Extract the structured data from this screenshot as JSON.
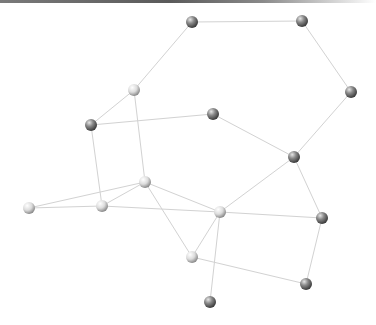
{
  "graph": {
    "colors": {
      "edge": "#d2d2d2",
      "node_light": "#f2f2f2",
      "node_dark": "#6e6e6e",
      "topbar": "#5a5a5a"
    },
    "nodes": [
      {
        "id": "n0",
        "x": 192,
        "y": 22,
        "shade": "dark"
      },
      {
        "id": "n1",
        "x": 302,
        "y": 21,
        "shade": "dark"
      },
      {
        "id": "n2",
        "x": 351,
        "y": 92,
        "shade": "dark"
      },
      {
        "id": "n3",
        "x": 134,
        "y": 90,
        "shade": "light"
      },
      {
        "id": "n4",
        "x": 91,
        "y": 125,
        "shade": "dark"
      },
      {
        "id": "n5",
        "x": 213,
        "y": 114,
        "shade": "dark"
      },
      {
        "id": "n6",
        "x": 294,
        "y": 157,
        "shade": "dark"
      },
      {
        "id": "n7",
        "x": 145,
        "y": 182,
        "shade": "light"
      },
      {
        "id": "n8",
        "x": 29,
        "y": 208,
        "shade": "light"
      },
      {
        "id": "n9",
        "x": 102,
        "y": 206,
        "shade": "light"
      },
      {
        "id": "n10",
        "x": 220,
        "y": 212,
        "shade": "light"
      },
      {
        "id": "n11",
        "x": 322,
        "y": 218,
        "shade": "dark"
      },
      {
        "id": "n12",
        "x": 192,
        "y": 257,
        "shade": "light"
      },
      {
        "id": "n13",
        "x": 306,
        "y": 284,
        "shade": "dark"
      },
      {
        "id": "n14",
        "x": 210,
        "y": 302,
        "shade": "dark"
      }
    ],
    "edges": [
      [
        "n0",
        "n1"
      ],
      [
        "n1",
        "n2"
      ],
      [
        "n2",
        "n6"
      ],
      [
        "n0",
        "n3"
      ],
      [
        "n3",
        "n4"
      ],
      [
        "n3",
        "n7"
      ],
      [
        "n4",
        "n5"
      ],
      [
        "n4",
        "n9"
      ],
      [
        "n5",
        "n6"
      ],
      [
        "n6",
        "n10"
      ],
      [
        "n6",
        "n11"
      ],
      [
        "n7",
        "n8"
      ],
      [
        "n7",
        "n9"
      ],
      [
        "n7",
        "n10"
      ],
      [
        "n7",
        "n12"
      ],
      [
        "n8",
        "n9"
      ],
      [
        "n9",
        "n10"
      ],
      [
        "n10",
        "n11"
      ],
      [
        "n10",
        "n12"
      ],
      [
        "n10",
        "n14"
      ],
      [
        "n11",
        "n13"
      ],
      [
        "n12",
        "n13"
      ]
    ]
  }
}
